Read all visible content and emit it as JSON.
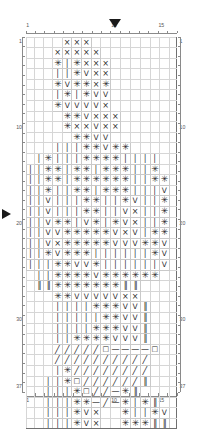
{
  "chart": {
    "kind": "knitting-stitch-chart",
    "columns": 16,
    "rows": 37,
    "cell_width_px": 9.44,
    "cell_height_px": 9.6,
    "heavy_line_every": 5,
    "grid_color": "#c9c9c9",
    "heavy_line_color": "#707070",
    "frame_color": "#5a5a5a",
    "symbol_color": "#2b2b2b",
    "marker_color": "#1a1a1a"
  },
  "axes": {
    "top_labels": [
      {
        "text": "1",
        "col": 1
      },
      {
        "text": "10",
        "col": 10
      },
      {
        "text": "15",
        "col": 15
      }
    ],
    "bottom_labels": [
      {
        "text": "1",
        "col": 1
      },
      {
        "text": "10",
        "col": 10
      },
      {
        "text": "15",
        "col": 15
      }
    ],
    "left_labels": [
      {
        "text": "1",
        "row": 1
      },
      {
        "text": "10",
        "row": 10
      },
      {
        "text": "20",
        "row": 20
      },
      {
        "text": "30",
        "row": 30
      },
      {
        "text": "37",
        "row": 37
      }
    ],
    "right_labels": [
      {
        "text": "1",
        "row": 1
      },
      {
        "text": "10",
        "row": 10
      },
      {
        "text": "20",
        "row": 20
      },
      {
        "text": "30",
        "row": 30
      },
      {
        "text": "37",
        "row": 37
      }
    ]
  },
  "markers": [
    {
      "name": "top-position-marker",
      "direction": "down",
      "col": 10
    },
    {
      "name": "left-position-marker",
      "direction": "right",
      "row": 19
    }
  ],
  "symbol_legend": {
    "x": {
      "glyph": "×",
      "name": "cross-stitch-symbol"
    },
    "star": {
      "glyph": "✳",
      "name": "asterisk-stitch-symbol"
    },
    "bar": {
      "glyph": "│",
      "name": "vertical-bar-stitch-symbol"
    },
    "v": {
      "glyph": "V",
      "name": "v-stitch-symbol"
    },
    "slash": {
      "glyph": "╱",
      "name": "slash-stitch-symbol"
    },
    "sq": {
      "glyph": "□",
      "name": "square-stitch-symbol"
    },
    "dash": {
      "glyph": "—",
      "name": "dash-stitch-symbol"
    },
    "dbar": {
      "glyph": "‖",
      "name": "double-bar-stitch-symbol"
    },
    "": {
      "glyph": "",
      "name": "empty-cell"
    }
  },
  "grid_rows": [
    [
      "",
      "",
      "",
      "",
      "x",
      "x",
      "x",
      "",
      "",
      "",
      "",
      "",
      "",
      "",
      "",
      ""
    ],
    [
      "",
      "",
      "",
      "x",
      "x",
      "x",
      "x",
      "x",
      "",
      "",
      "",
      "",
      "",
      "",
      "",
      ""
    ],
    [
      "",
      "",
      "",
      "star",
      "bar",
      "star",
      "x",
      "x",
      "x",
      "",
      "",
      "",
      "",
      "",
      "",
      ""
    ],
    [
      "",
      "",
      "",
      "bar",
      "bar",
      "star",
      "v",
      "x",
      "x",
      "",
      "",
      "",
      "",
      "",
      "",
      ""
    ],
    [
      "",
      "",
      "",
      "star",
      "v",
      "star",
      "star",
      "x",
      "star",
      "",
      "",
      "",
      "",
      "",
      "",
      ""
    ],
    [
      "",
      "",
      "",
      "bar",
      "star",
      "bar",
      "star",
      "v",
      "v",
      "",
      "",
      "",
      "",
      "",
      "",
      ""
    ],
    [
      "",
      "",
      "",
      "star",
      "v",
      "v",
      "v",
      "v",
      "x",
      "",
      "",
      "",
      "",
      "",
      "",
      ""
    ],
    [
      "",
      "",
      "",
      "",
      "star",
      "star",
      "v",
      "x",
      "x",
      "x",
      "",
      "",
      "",
      "",
      "",
      ""
    ],
    [
      "",
      "",
      "",
      "",
      "star",
      "x",
      "x",
      "v",
      "x",
      "x",
      "",
      "",
      "",
      "",
      "",
      ""
    ],
    [
      "",
      "",
      "",
      "",
      "",
      "star",
      "star",
      "v",
      "v",
      "",
      "",
      "",
      "",
      "",
      "",
      ""
    ],
    [
      "",
      "",
      "",
      "bar",
      "bar",
      "bar",
      "star",
      "star",
      "v",
      "star",
      "star",
      "",
      "",
      "",
      "",
      ""
    ],
    [
      "",
      "bar",
      "star",
      "bar",
      "bar",
      "bar",
      "star",
      "star",
      "star",
      "star",
      "bar",
      "bar",
      "bar",
      "bar",
      "",
      ""
    ],
    [
      "bar",
      "bar",
      "star",
      "star",
      "bar",
      "star",
      "star",
      "bar",
      "star",
      "star",
      "star",
      "bar",
      "bar",
      "star",
      "",
      ""
    ],
    [
      "bar",
      "bar",
      "star",
      "star",
      "bar",
      "star",
      "star",
      "star",
      "star",
      "star",
      "star",
      "bar",
      "bar",
      "star",
      "star",
      ""
    ],
    [
      "bar",
      "bar",
      "star",
      "bar",
      "bar",
      "star",
      "star",
      "bar",
      "star",
      "star",
      "star",
      "bar",
      "bar",
      "bar",
      "v",
      ""
    ],
    [
      "bar",
      "bar",
      "v",
      "bar",
      "bar",
      "bar",
      "star",
      "star",
      "bar",
      "bar",
      "star",
      "v",
      "bar",
      "bar",
      "star",
      ""
    ],
    [
      "bar",
      "bar",
      "v",
      "bar",
      "bar",
      "bar",
      "star",
      "star",
      "bar",
      "bar",
      "v",
      "x",
      "bar",
      "bar",
      "star",
      ""
    ],
    [
      "bar",
      "bar",
      "v",
      "star",
      "star",
      "bar",
      "v",
      "star",
      "bar",
      "star",
      "v",
      "x",
      "bar",
      "bar",
      "star",
      ""
    ],
    [
      "bar",
      "bar",
      "v",
      "v",
      "star",
      "star",
      "star",
      "star",
      "star",
      "v",
      "x",
      "v",
      "bar",
      "star",
      "star",
      ""
    ],
    [
      "bar",
      "bar",
      "v",
      "x",
      "star",
      "star",
      "star",
      "star",
      "star",
      "v",
      "v",
      "v",
      "star",
      "star",
      "v",
      ""
    ],
    [
      "bar",
      "bar",
      "star",
      "v",
      "star",
      "star",
      "star",
      "bar",
      "bar",
      "bar",
      "bar",
      "bar",
      "bar",
      "star",
      "v",
      ""
    ],
    [
      "bar",
      "bar",
      "bar",
      "star",
      "star",
      "v",
      "v",
      "star",
      "bar",
      "bar",
      "bar",
      "bar",
      "bar",
      "bar",
      "v",
      ""
    ],
    [
      "",
      "bar",
      "bar",
      "star",
      "star",
      "star",
      "star",
      "v",
      "star",
      "star",
      "star",
      "star",
      "star",
      "star",
      "",
      ""
    ],
    [
      "",
      "dbar",
      "dbar",
      "star",
      "star",
      "star",
      "star",
      "star",
      "star",
      "star",
      "dbar",
      "dbar",
      "",
      "",
      "",
      ""
    ],
    [
      "",
      "",
      "",
      "star",
      "star",
      "v",
      "v",
      "v",
      "v",
      "v",
      "x",
      "x",
      "",
      "",
      "",
      ""
    ],
    [
      "",
      "",
      "",
      "bar",
      "bar",
      "bar",
      "bar",
      "star",
      "star",
      "star",
      "v",
      "v",
      "dbar",
      "",
      "",
      ""
    ],
    [
      "",
      "",
      "",
      "bar",
      "bar",
      "bar",
      "bar",
      "bar",
      "star",
      "star",
      "v",
      "v",
      "dbar",
      "",
      "",
      ""
    ],
    [
      "",
      "",
      "",
      "bar",
      "bar",
      "bar",
      "bar",
      "star",
      "star",
      "star",
      "v",
      "v",
      "dbar",
      "",
      "",
      ""
    ],
    [
      "",
      "",
      "",
      "bar",
      "bar",
      "star",
      "star",
      "star",
      "star",
      "v",
      "v",
      "v",
      "dbar",
      "",
      "",
      ""
    ],
    [
      "",
      "",
      "",
      "slash",
      "slash",
      "slash",
      "slash",
      "slash",
      "sq",
      "dash",
      "dash",
      "dash",
      "dash",
      "sq",
      "",
      ""
    ],
    [
      "",
      "",
      "",
      "slash",
      "slash",
      "slash",
      "slash",
      "slash",
      "slash",
      "slash",
      "slash",
      "slash",
      "slash",
      "",
      "",
      ""
    ],
    [
      "",
      "",
      "",
      "bar",
      "star",
      "slash",
      "slash",
      "slash",
      "slash",
      "slash",
      "slash",
      "slash",
      "slash",
      "",
      "",
      ""
    ],
    [
      "",
      "",
      "bar",
      "bar",
      "star",
      "sq",
      "slash",
      "slash",
      "slash",
      "slash",
      "slash",
      "slash",
      "dbar",
      "",
      "",
      ""
    ],
    [
      "",
      "",
      "bar",
      "bar",
      "bar",
      "star",
      "sq",
      "slash",
      "slash",
      "dash",
      "star",
      "dbar",
      "",
      "",
      "",
      ""
    ],
    [
      "",
      "",
      "bar",
      "bar",
      "bar",
      "star",
      "star",
      "dash",
      "slash",
      "dash",
      "star",
      "bar",
      "star",
      "dbar",
      "",
      ""
    ],
    [
      "",
      "",
      "bar",
      "bar",
      "bar",
      "star",
      "v",
      "x",
      "",
      "",
      "star",
      "bar",
      "bar",
      "star",
      "v",
      ""
    ],
    [
      "",
      "",
      "bar",
      "bar",
      "bar",
      "star",
      "v",
      "x",
      "",
      "",
      "star",
      "star",
      "star",
      "dbar",
      "dbar",
      ""
    ]
  ]
}
